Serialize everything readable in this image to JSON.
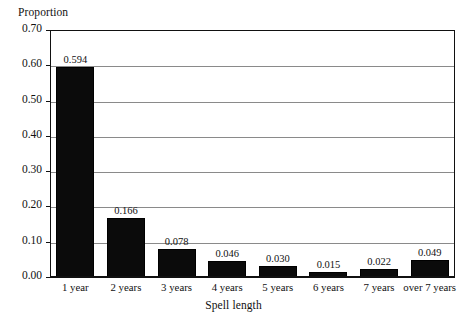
{
  "chart_data": {
    "type": "bar",
    "title": "",
    "xlabel": "Spell length",
    "ylabel": "Proportion",
    "categories": [
      "1 year",
      "2 years",
      "3 years",
      "4 years",
      "5 years",
      "6 years",
      "7 years",
      "over 7 years"
    ],
    "values": [
      0.594,
      0.166,
      0.078,
      0.046,
      0.03,
      0.015,
      0.022,
      0.049
    ],
    "value_labels": [
      "0.594",
      "0.166",
      "0.078",
      "0.046",
      "0.030",
      "0.015",
      "0.022",
      "0.049"
    ],
    "ylim": [
      0.0,
      0.7
    ],
    "ytick_values": [
      0.0,
      0.1,
      0.2,
      0.3,
      0.4,
      0.5,
      0.6,
      0.7
    ],
    "ytick_labels": [
      "0.00",
      "0.10",
      "0.20",
      "0.30",
      "0.40",
      "0.50",
      "0.60",
      "0.70"
    ],
    "grid": true,
    "grid_axis": "y",
    "legend": "none",
    "bar_color": "#0b0b0b",
    "gridline_color": "#8a8a8a",
    "axis_color": "#111111",
    "background": "#ffffff"
  }
}
